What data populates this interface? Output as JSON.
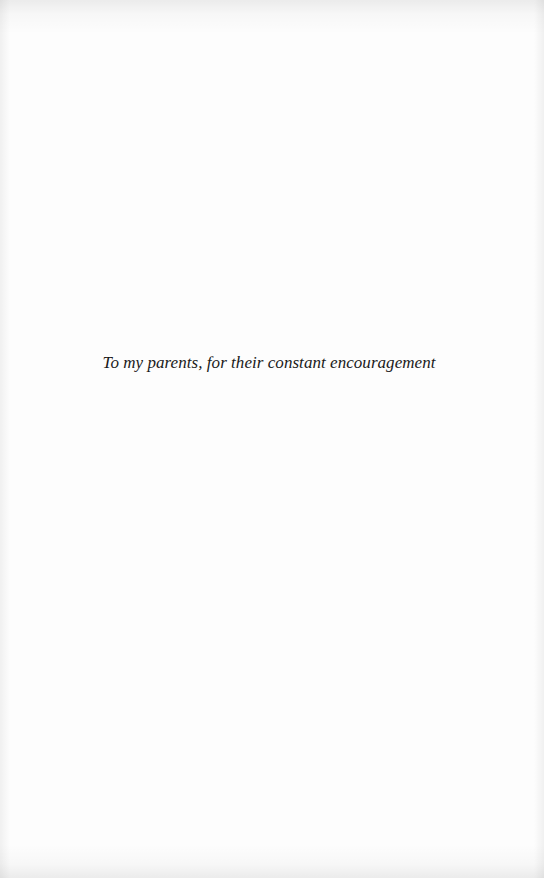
{
  "page": {
    "type": "dedication",
    "dedication_text": "To my parents, for their constant encouragement"
  },
  "colors": {
    "paper": "#fdfdfd",
    "text": "#1a1a1a"
  }
}
